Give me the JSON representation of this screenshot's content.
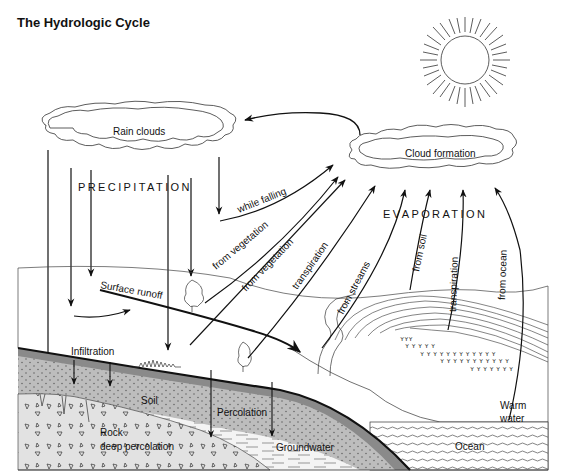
{
  "title": "The Hydrologic Cycle",
  "clouds": {
    "rain": "Rain clouds",
    "formation": "Cloud formation"
  },
  "headings": {
    "precipitation": "PRECIPITATION",
    "evaporation": "EVAPORATION"
  },
  "arrows": {
    "while_falling": "while falling",
    "from_vegetation_1": "from vegetation",
    "from_vegetation_2": "from vegetation",
    "transpiration_land": "transpiration",
    "from_streams": "from streams",
    "from_soil": "from soil",
    "transpiration_marsh": "transpiration",
    "from_ocean": "from ocean"
  },
  "ground_labels": {
    "surface_runoff": "Surface runoff",
    "infiltration": "Infiltration",
    "soil": "Soil",
    "percolation": "Percolation",
    "rock": "Rock",
    "deep_percolation": "deep percolation",
    "groundwater": "Groundwater",
    "warm": "Warm",
    "water": "water",
    "ocean": "Ocean"
  },
  "colors": {
    "line": "#111111",
    "topsoil": "#8a8a8a",
    "soil": "#bdbdbd",
    "rock": "#e2e2e2",
    "groundwater": "#f4f4f4"
  }
}
